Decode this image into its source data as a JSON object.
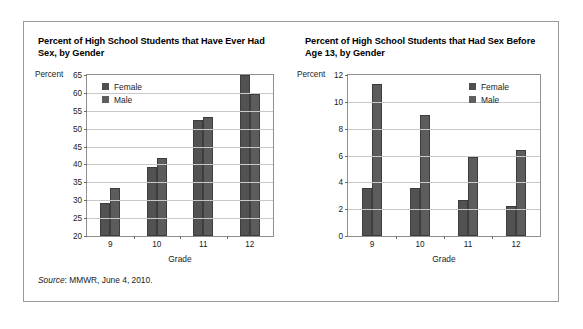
{
  "figure": {
    "source_prefix": "Source",
    "source_text": ": MMWR, June 4, 2010."
  },
  "panels": [
    {
      "title": "Percent of High School Students that Have Ever Had Sex, by Gender",
      "unit_label": "Percent",
      "xaxis_title": "Grade",
      "legend": [
        "Female",
        "Male"
      ]
    },
    {
      "title": "Percent of High School Students that Had Sex Before Age 13, by Gender",
      "unit_label": "Percent",
      "xaxis_title": "Grade",
      "legend": [
        "Female",
        "Male"
      ]
    }
  ],
  "colors": {
    "female": "#4f4f4f",
    "male": "#5e5e5e",
    "frame": "#9a9a9a",
    "gridline": "#c8c8c8"
  },
  "chart_data": [
    {
      "type": "bar",
      "title": "Percent of High School Students that Have Ever Had Sex, by Gender",
      "xlabel": "Grade",
      "ylabel": "Percent",
      "categories": [
        "9",
        "10",
        "11",
        "12"
      ],
      "series": [
        {
          "name": "Female",
          "values": [
            29.2,
            39.4,
            52.3,
            65.0
          ]
        },
        {
          "name": "Male",
          "values": [
            33.5,
            41.8,
            53.4,
            59.6
          ]
        }
      ],
      "ylim": [
        20,
        65
      ],
      "yticks": [
        20,
        25,
        30,
        35,
        40,
        45,
        50,
        55,
        60,
        65
      ],
      "grid": true,
      "legend_position": "top-left"
    },
    {
      "type": "bar",
      "title": "Percent of High School Students that Had Sex Before Age 13, by Gender",
      "xlabel": "Grade",
      "ylabel": "Percent",
      "categories": [
        "9",
        "10",
        "11",
        "12"
      ],
      "series": [
        {
          "name": "Female",
          "values": [
            3.6,
            3.6,
            2.7,
            2.2
          ]
        },
        {
          "name": "Male",
          "values": [
            11.3,
            9.0,
            5.9,
            6.4
          ]
        }
      ],
      "ylim": [
        0,
        12
      ],
      "yticks": [
        0,
        2,
        4,
        6,
        8,
        10,
        12
      ],
      "grid": true,
      "legend_position": "top-right"
    }
  ]
}
